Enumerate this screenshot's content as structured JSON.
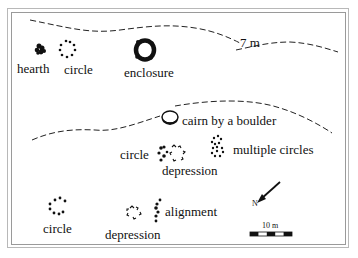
{
  "diagram": {
    "contours": [
      {
        "label": "7 m"
      }
    ],
    "features": [
      {
        "id": "hearth",
        "label": "hearth"
      },
      {
        "id": "circle-top",
        "label": "circle"
      },
      {
        "id": "enclosure",
        "label": "enclosure"
      },
      {
        "id": "cairn",
        "label": "cairn by a boulder"
      },
      {
        "id": "circle-mid",
        "label": "circle"
      },
      {
        "id": "depression-mid",
        "label": "depression"
      },
      {
        "id": "multiple-circles",
        "label": "multiple circles"
      },
      {
        "id": "circle-bottom",
        "label": "circle"
      },
      {
        "id": "depression-bottom",
        "label": "depression"
      },
      {
        "id": "alignment",
        "label": "alignment"
      }
    ],
    "north_arrow": {
      "label": "N"
    },
    "scale_bar": {
      "label": "10 m",
      "segments": 5
    }
  }
}
